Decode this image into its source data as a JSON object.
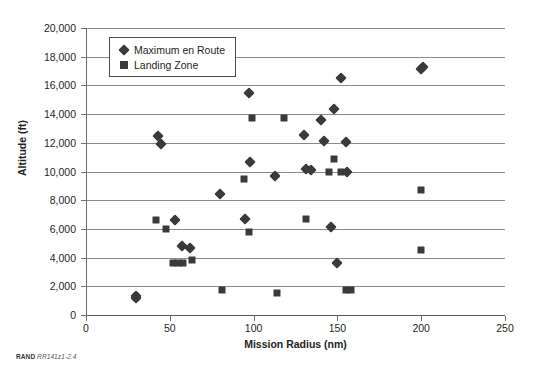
{
  "chart_data": {
    "type": "scatter",
    "title": "",
    "xlabel": "Mission Radius (nm)",
    "ylabel": "Altitude (ft)",
    "xlim": [
      0,
      250
    ],
    "ylim": [
      0,
      20000
    ],
    "xticks": [
      0,
      50,
      100,
      150,
      200,
      250
    ],
    "xtick_labels": [
      "0",
      "50",
      "100",
      "150",
      "200",
      "250"
    ],
    "yticks": [
      0,
      2000,
      4000,
      6000,
      8000,
      10000,
      12000,
      14000,
      16000,
      18000,
      20000
    ],
    "ytick_labels": [
      "0",
      "2,000",
      "4,000",
      "6,000",
      "8,000",
      "10,000",
      "12,000",
      "14,000",
      "16,000",
      "18,000",
      "20,000"
    ],
    "grid": "horizontal",
    "legend_position": "upper-left-inside",
    "series": [
      {
        "name": "Maximum en Route",
        "marker": "diamond",
        "color": "#3a3a3a",
        "points": [
          [
            30,
            1350
          ],
          [
            30,
            1150
          ],
          [
            43,
            12450
          ],
          [
            45,
            11950
          ],
          [
            53,
            6600
          ],
          [
            57,
            4800
          ],
          [
            62,
            4700
          ],
          [
            80,
            8400
          ],
          [
            95,
            6700
          ],
          [
            97,
            15450
          ],
          [
            98,
            10650
          ],
          [
            113,
            9700
          ],
          [
            130,
            12550
          ],
          [
            131,
            10150
          ],
          [
            134,
            10100
          ],
          [
            140,
            13600
          ],
          [
            142,
            12100
          ],
          [
            146,
            6150
          ],
          [
            148,
            14350
          ],
          [
            150,
            3600
          ],
          [
            152,
            16550
          ],
          [
            155,
            12050
          ],
          [
            156,
            9950
          ],
          [
            200,
            17150
          ],
          [
            201,
            17250
          ]
        ]
      },
      {
        "name": "Landing Zone",
        "marker": "square",
        "color": "#3a3a3a",
        "points": [
          [
            30,
            1250
          ],
          [
            42,
            6600
          ],
          [
            48,
            6000
          ],
          [
            52,
            3600
          ],
          [
            55,
            3600
          ],
          [
            58,
            3600
          ],
          [
            63,
            3800
          ],
          [
            81,
            1750
          ],
          [
            94,
            9450
          ],
          [
            97,
            5800
          ],
          [
            99,
            13750
          ],
          [
            114,
            1500
          ],
          [
            118,
            13750
          ],
          [
            131,
            6700
          ],
          [
            145,
            9950
          ],
          [
            148,
            10900
          ],
          [
            152,
            9950
          ],
          [
            155,
            1750
          ],
          [
            158,
            1750
          ],
          [
            200,
            8700
          ],
          [
            200,
            4550
          ]
        ]
      }
    ]
  },
  "caption": {
    "brand": "RAND",
    "reference": "RR141z1-2.4"
  },
  "legend": {
    "items": [
      {
        "label": "Maximum en Route",
        "marker": "diamond"
      },
      {
        "label": "Landing Zone",
        "marker": "square"
      }
    ]
  }
}
